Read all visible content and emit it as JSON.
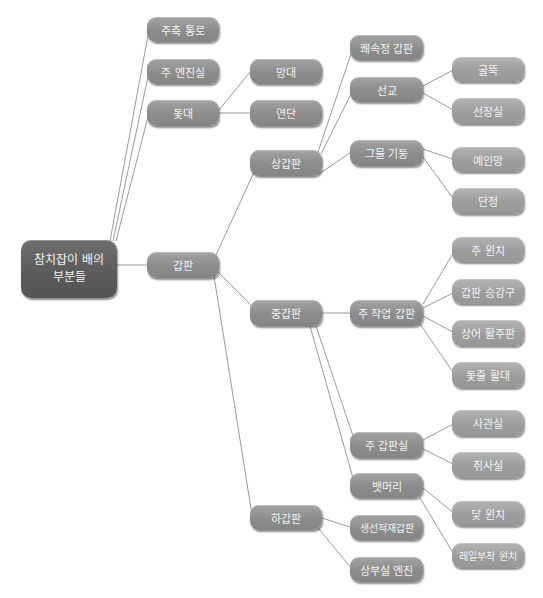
{
  "diagram": {
    "title": "참치잡이 배의 부분들",
    "root": {
      "label": "참치잡이 배의 부분들"
    },
    "level1": {
      "jujuk_tongro": "주축 통로",
      "ju_enjinsil": "주 엔진실",
      "dotdae": "돛대",
      "gapan": "갑판"
    },
    "dotdae_children": {
      "mangdae": "망대",
      "yeondan": "연단"
    },
    "gapan_children": {
      "sang_gapan": "상갑판",
      "jung_gapan": "중갑판",
      "ha_gapan": "하갑판"
    },
    "sang_gapan_children": {
      "kwaesokjeong_gapan": "쾌속정 갑판",
      "seongyo": "선교",
      "geumul_gidung": "그물 기둥"
    },
    "seongyo_children": {
      "gulttuk": "굴뚝",
      "seonjangsil": "선장실"
    },
    "geumul_gidung_children": {
      "yeinmang": "예인망",
      "danjeong": "단정"
    },
    "jung_gapan_children": {
      "ju_jageop_gapan": "주 작업 갑판",
      "ju_gapansil": "주 갑판실",
      "baenmeori": "뱃머리"
    },
    "ju_jageop_gapan_children": {
      "ju_winchi": "주 윈치",
      "gapan_seunggangu": "갑판 승강구",
      "sangeo_hwaljupan": "상어 활주판",
      "dotjul_hwaldae": "돛줄 활대"
    },
    "ju_gapansil_children": {
      "sagwansil": "사관실",
      "chwisasil": "취사실"
    },
    "baenmeori_children": {
      "dat_winchi": "닻 윈치",
      "reilbuchak_winchi": "레일부착 윈치"
    },
    "ha_gapan_children": {
      "saengseon_jeokjae_gapan": "생선적재갑판",
      "sangbusil_enjin": "상부실 엔진"
    }
  },
  "colors": {
    "root_fill": "#5f5f5f",
    "node_fill": "#8f8f8f",
    "leaf_fill": "#a0a0a0",
    "text": "#f4f4f4",
    "edge": "#8a8a8a",
    "background": "#ffffff"
  }
}
